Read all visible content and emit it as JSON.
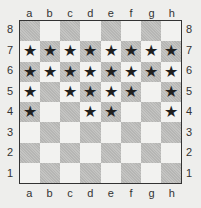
{
  "files": [
    "a",
    "b",
    "c",
    "d",
    "e",
    "f",
    "g",
    "h"
  ],
  "ranks": [
    "8",
    "7",
    "6",
    "5",
    "4",
    "3",
    "2",
    "1"
  ],
  "colors": {
    "light_square": "#f2f2f0",
    "dark_square": "#c4c4c2",
    "star": "#1f1f1f",
    "border": "#333333"
  },
  "marker_symbol": "★",
  "marked_squares": [
    "a7",
    "b7",
    "c7",
    "d7",
    "e7",
    "f7",
    "g7",
    "h7",
    "a6",
    "b6",
    "c6",
    "d6",
    "e6",
    "f6",
    "g6",
    "h6",
    "a5",
    "c5",
    "d5",
    "e5",
    "f5",
    "h5",
    "a4",
    "d4",
    "e4",
    "h4"
  ]
}
